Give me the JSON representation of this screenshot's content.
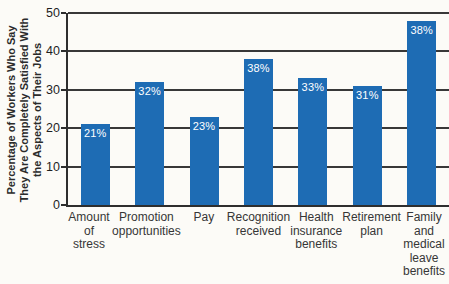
{
  "chart_data": {
    "type": "bar",
    "title": "",
    "ylabel": "Percentage of Workers Who Say\nThey Are Completely Satisfied With\nthe Aspects of Their Jobs",
    "xlabel": "",
    "categories": [
      "Amount\nof\nstress",
      "Promotion\nopportunities",
      "Pay",
      "Recognition\nreceived",
      "Health\ninsurance\nbenefits",
      "Retirement\nplan",
      "Family\nand\nmedical\nleave\nbenefits"
    ],
    "values": [
      21,
      32,
      23,
      38,
      33,
      31,
      38
    ],
    "bar_value_labels": [
      "21%",
      "32%",
      "23%",
      "38%",
      "33%",
      "31%",
      "38%"
    ],
    "values_as_drawn": [
      21,
      32,
      23,
      38,
      33,
      31,
      48
    ],
    "ylim": [
      0,
      50
    ],
    "yticks": [
      0,
      10,
      20,
      30,
      40,
      50
    ],
    "grid": true,
    "legend_position": "none",
    "colors": {
      "bar": "#1e6cb4",
      "bar_label": "#ffffff",
      "gridline": "#383838",
      "axis": "#2e2e2e",
      "tick_label": "#1f1f1f",
      "category_label": "#363636",
      "background": "#fcfbf7"
    }
  }
}
